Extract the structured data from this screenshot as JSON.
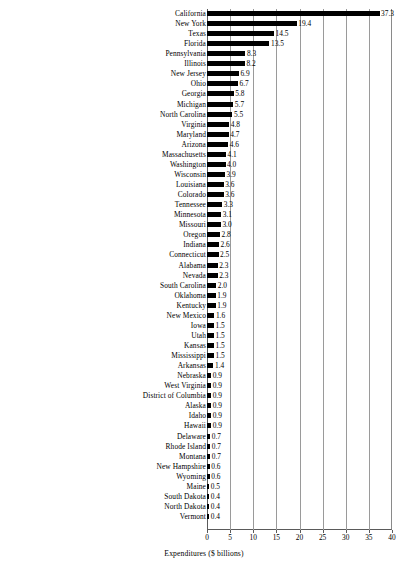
{
  "chart_data": {
    "type": "bar",
    "orientation": "horizontal",
    "title": "",
    "xlabel": "Expenditures ($ billions)",
    "ylabel": "",
    "xlim": [
      0,
      40
    ],
    "xticks": [
      0,
      5,
      10,
      15,
      20,
      25,
      30,
      35,
      40
    ],
    "xtick_labels": [
      "0",
      "5",
      "10",
      "15",
      "20",
      "25",
      "30",
      "35",
      "40"
    ],
    "grid": true,
    "grid_axis": "x",
    "legend": false,
    "bar_color": "#000000",
    "value_label_format": "one-decimal",
    "categories": [
      "California",
      "New York",
      "Texas",
      "Florida",
      "Pennsylvania",
      "Illinois",
      "New Jersey",
      "Ohio",
      "Georgia",
      "Michigan",
      "North Carolina",
      "Virginia",
      "Maryland",
      "Arizona",
      "Massachusetts",
      "Washington",
      "Wisconsin",
      "Louisiana",
      "Colorado",
      "Tennessee",
      "Minnesota",
      "Missouri",
      "Oregon",
      "Indiana",
      "Connecticut",
      "Alabama",
      "Nevada",
      "South Carolina",
      "Oklahoma",
      "Kentucky",
      "New Mexico",
      "Iowa",
      "Utah",
      "Kansas",
      "Mississippi",
      "Arkansas",
      "Nebraska",
      "West Virginia",
      "District of Columbia",
      "Alaska",
      "Idaho",
      "Hawaii",
      "Delaware",
      "Rhode Island",
      "Montana",
      "New Hampshire",
      "Wyoming",
      "Maine",
      "South Dakota",
      "North Dakota",
      "Vermont"
    ],
    "values": [
      37.3,
      19.4,
      14.5,
      13.5,
      8.3,
      8.2,
      6.9,
      6.7,
      5.8,
      5.7,
      5.5,
      4.8,
      4.7,
      4.6,
      4.1,
      4.0,
      3.9,
      3.6,
      3.6,
      3.3,
      3.1,
      3.0,
      2.8,
      2.6,
      2.5,
      2.3,
      2.3,
      2.0,
      1.9,
      1.9,
      1.6,
      1.5,
      1.5,
      1.5,
      1.5,
      1.4,
      0.9,
      0.9,
      0.9,
      0.9,
      0.9,
      0.9,
      0.7,
      0.7,
      0.7,
      0.6,
      0.6,
      0.5,
      0.4,
      0.4,
      0.4
    ],
    "value_labels": [
      "37.3",
      "19.4",
      "14.5",
      "13.5",
      "8.3",
      "8.2",
      "6.9",
      "6.7",
      "5.8",
      "5.7",
      "5.5",
      "4.8",
      "4.7",
      "4.6",
      "4.1",
      "4.0",
      "3.9",
      "3.6",
      "3.6",
      "3.3",
      "3.1",
      "3.0",
      "2.8",
      "2.6",
      "2.5",
      "2.3",
      "2.3",
      "2.0",
      "1.9",
      "1.9",
      "1.6",
      "1.5",
      "1.5",
      "1.5",
      "1.5",
      "1.4",
      "0.9",
      "0.9",
      "0.9",
      "0.9",
      "0.9",
      "0.9",
      "0.7",
      "0.7",
      "0.7",
      "0.6",
      "0.6",
      "0.5",
      "0.4",
      "0.4",
      "0.4"
    ]
  }
}
